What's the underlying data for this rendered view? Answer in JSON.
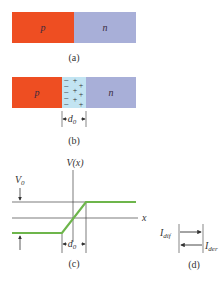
{
  "colors": {
    "p_region": "#EE4E22",
    "n_region": "#A8AFD8",
    "depletion_region": "#C2E4F2",
    "potential_curve": "#6DB54B",
    "lines": "#444444"
  },
  "panel_a": {
    "p_label": "p",
    "n_label": "n",
    "caption": "(a)"
  },
  "panel_b": {
    "p_label": "p",
    "n_label": "n",
    "negative_charges": [
      "−",
      "−",
      "−",
      "−",
      "−"
    ],
    "positive_charges": [
      "+",
      "+",
      "+",
      "+",
      "+",
      "+"
    ],
    "width_label": "d",
    "width_subscript": "0",
    "caption": "(b)"
  },
  "panel_c": {
    "y_axis_label": "V(x)",
    "x_axis_label": "x",
    "barrier_label": "V",
    "barrier_subscript": "0",
    "width_label": "d",
    "width_subscript": "0",
    "caption": "(c)"
  },
  "panel_d": {
    "diffusion_current_label": "I",
    "diffusion_current_subscript": "dif",
    "drift_current_label": "I",
    "drift_current_subscript": "der",
    "caption": "(d)"
  }
}
